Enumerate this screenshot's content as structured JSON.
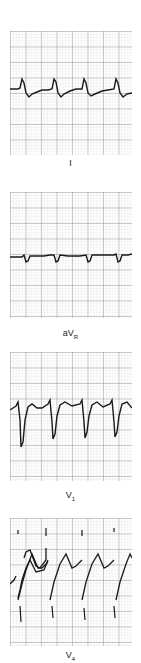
{
  "figure": {
    "grid": {
      "minor_color": "#d9d9d9",
      "major_color": "#8a8a8a",
      "trace_color": "#1a1a1a"
    },
    "leads": [
      {
        "name": "I",
        "label_main": "I",
        "label_sub": ""
      },
      {
        "name": "aVR",
        "label_main": "aV",
        "label_sub": "R"
      },
      {
        "name": "V1",
        "label_main": "V",
        "label_sub": "1"
      },
      {
        "name": "V4",
        "label_main": "V",
        "label_sub": "4"
      }
    ]
  }
}
